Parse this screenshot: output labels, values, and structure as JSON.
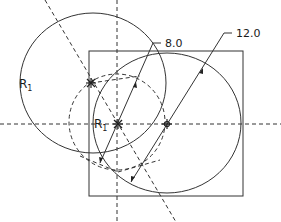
{
  "diagram": {
    "type": "geometric-construction",
    "colors": {
      "stroke": "#333333",
      "background": "#ffffff"
    },
    "labels": {
      "r1_outer": {
        "base": "R",
        "sub": "1"
      },
      "r1_center": {
        "base": "R",
        "sub": "1"
      },
      "dim_small": "8.0",
      "dim_large": "12.0"
    },
    "shapes": {
      "square": {
        "x": 89,
        "y": 51,
        "w": 154,
        "h": 145
      },
      "circle_r1": {
        "cx": 93,
        "cy": 83,
        "rx": 73,
        "ry": 70
      },
      "circle_large": {
        "cx": 167,
        "cy": 123,
        "rx": 74,
        "ry": 70
      },
      "circle_dashed": {
        "cx": 117,
        "cy": 122,
        "rx": 48,
        "ry": 48
      }
    },
    "centers": [
      {
        "name": "r1-center-point",
        "x": 91,
        "y": 83
      },
      {
        "name": "origin-center-point",
        "x": 118,
        "y": 124
      },
      {
        "name": "large-center-point",
        "x": 167,
        "y": 124
      }
    ]
  }
}
